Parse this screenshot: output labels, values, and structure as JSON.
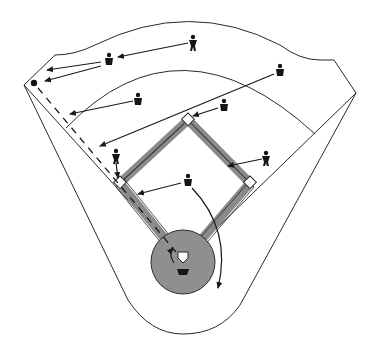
{
  "diagram": {
    "title": "Baseball relay play diagram: ball hit down the left-field line",
    "colors": {
      "background": "#ffffff",
      "line": "#2a2a2a",
      "basepath": "#8a8a8a",
      "mound": "#8f8f8f",
      "player": "#151515"
    },
    "field": {
      "home_plate": [
        183,
        261
      ],
      "first_base": [
        250,
        183
      ],
      "second_base": [
        188,
        120
      ],
      "third_base": [
        120,
        183
      ],
      "mound_radius": 32,
      "ball_position": [
        34,
        83
      ],
      "left_corner": [
        24,
        85
      ],
      "right_corner": [
        356,
        93
      ]
    },
    "players": [
      {
        "role": "center-fielder",
        "position": [
          193,
          42
        ]
      },
      {
        "role": "left-fielder",
        "position": [
          109,
          60
        ]
      },
      {
        "role": "shortstop",
        "position": [
          138,
          100
        ]
      },
      {
        "role": "right-fielder",
        "position": [
          280,
          71
        ]
      },
      {
        "role": "second-baseman",
        "position": [
          224,
          106
        ]
      },
      {
        "role": "third-baseman",
        "position": [
          116,
          156
        ]
      },
      {
        "role": "first-baseman",
        "position": [
          266,
          158
        ]
      },
      {
        "role": "pitcher",
        "position": [
          188,
          181
        ]
      },
      {
        "role": "catcher",
        "position": [
          183,
          272
        ]
      }
    ],
    "legend": "Players' movements shown with arrows; dashed line shows relay path down the third-base line"
  }
}
